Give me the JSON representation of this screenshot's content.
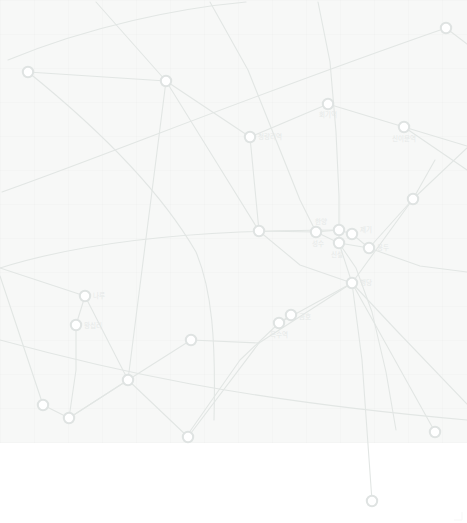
{
  "map": {
    "title": "Seoul Metropolitan Subway Map",
    "panel": {
      "x": 0,
      "y": 0,
      "width": 467,
      "height": 443,
      "background_color": "#f7f8f7"
    },
    "canvas": {
      "width": 467,
      "height": 523,
      "background_color": "#ffffff"
    },
    "style": {
      "node_fill": "#ffffff",
      "node_stroke": "#dfe3e2",
      "node_radius": 5.2,
      "node_stroke_width": 2.0,
      "line_color": "#e2e6e4",
      "line_width": 1.1,
      "label_color": "#e6e9e8",
      "label_font_size": 6.5,
      "opacity_note": "entire map rendered at very low contrast / faded"
    },
    "lines": [
      {
        "id": "line-a",
        "color": "#e2e6e4",
        "path": "M 8,60 C 90,26 180,8 246,2"
      },
      {
        "id": "line-b",
        "color": "#e2e6e4",
        "path": "M 2,192 C 120,150 250,96 446,28"
      },
      {
        "id": "line-c",
        "color": "#e2e6e4",
        "path": "M 28,72 L 166,81 L 250,137 L 328,104 L 404,127 L 467,146"
      },
      {
        "id": "line-d",
        "color": "#e2e6e4",
        "path": "M 96,2 L 166,81 L 215,160 L 259,231 L 300,265 L 352,283 L 396,330 L 467,404"
      },
      {
        "id": "line-e",
        "color": "#e2e6e4",
        "path": "M 210,2 L 248,70 L 276,140 L 300,200 L 316,232 L 339,243 L 356,268 L 372,312 L 386,372 L 396,430"
      },
      {
        "id": "line-f",
        "color": "#e2e6e4",
        "path": "M 318,2 L 330,62 L 336,132 L 339,196 L 339,230 L 339,243 L 352,283 L 362,360 L 372,501"
      },
      {
        "id": "line-g",
        "color": "#e2e6e4",
        "path": "M 28,72 C 100,130 160,190 196,252 C 212,290 216,340 214,420"
      },
      {
        "id": "line-h",
        "color": "#e2e6e4",
        "path": "M 0,268 C 70,246 150,236 240,232 C 300,230 330,230 339,230"
      },
      {
        "id": "line-i",
        "color": "#e2e6e4",
        "path": "M 0,268 L 85,296 L 128,380 L 188,437 L 259,343 L 352,283 L 413,199 L 467,148"
      },
      {
        "id": "line-j",
        "color": "#e2e6e4",
        "path": "M 0,276 L 43,405 L 69,418 L 128,380 L 191,340 L 259,343"
      },
      {
        "id": "line-k",
        "color": "#e2e6e4",
        "path": "M 76,325 L 76,370 L 69,418 L 128,380"
      },
      {
        "id": "line-l",
        "color": "#e2e6e4",
        "path": "M 85,296 L 76,325"
      },
      {
        "id": "line-m",
        "color": "#e2e6e4",
        "path": "M 339,243 L 369,248 L 413,199 L 435,160"
      },
      {
        "id": "line-n",
        "color": "#e2e6e4",
        "path": "M 352,234 L 369,248 L 420,266 L 467,272"
      },
      {
        "id": "line-o",
        "color": "#e2e6e4",
        "path": "M 250,137 L 259,231 L 316,232 L 339,230 L 352,234"
      },
      {
        "id": "line-p",
        "color": "#e2e6e4",
        "path": "M 291,315 L 279,323 L 240,360 L 186,437"
      },
      {
        "id": "line-q",
        "color": "#e2e6e4",
        "path": "M 279,323 L 352,283"
      },
      {
        "id": "line-r",
        "color": "#e2e6e4",
        "path": "M 352,283 L 435,432"
      },
      {
        "id": "line-s",
        "color": "#e2e6e4",
        "path": "M 0,340 C 110,370 240,400 467,420"
      },
      {
        "id": "line-t",
        "color": "#e2e6e4",
        "path": "M 404,127 L 467,170"
      },
      {
        "id": "line-u",
        "color": "#e2e6e4",
        "path": "M 166,81 L 128,380"
      },
      {
        "id": "line-v",
        "color": "#e2e6e4",
        "path": "M 446,28 L 467,44"
      }
    ],
    "stations": [
      {
        "id": "st-01",
        "label": "",
        "x": 28,
        "y": 72
      },
      {
        "id": "st-02",
        "label": "",
        "x": 166,
        "y": 81
      },
      {
        "id": "st-03",
        "label": "",
        "x": 446,
        "y": 28
      },
      {
        "id": "st-04",
        "label": "회기역",
        "x": 328,
        "y": 104,
        "label_dx": 0,
        "label_dy": 13,
        "anchor": "middle"
      },
      {
        "id": "st-05",
        "label": "청량리역",
        "x": 250,
        "y": 137,
        "label_dx": 8,
        "label_dy": 2,
        "anchor": "start"
      },
      {
        "id": "st-06",
        "label": "신이문역",
        "x": 404,
        "y": 127,
        "label_dx": 0,
        "label_dy": 14,
        "anchor": "middle"
      },
      {
        "id": "st-07",
        "label": "",
        "x": 413,
        "y": 199
      },
      {
        "id": "st-08",
        "label": "",
        "x": 259,
        "y": 231
      },
      {
        "id": "st-09",
        "label": "한양",
        "x": 339,
        "y": 230,
        "label_dx": -12,
        "label_dy": -6,
        "anchor": "end"
      },
      {
        "id": "st-10",
        "label": "제기",
        "x": 352,
        "y": 234,
        "label_dx": 8,
        "label_dy": -2,
        "anchor": "start"
      },
      {
        "id": "st-11",
        "label": "신설",
        "x": 339,
        "y": 243,
        "label_dx": -2,
        "label_dy": 14,
        "anchor": "middle"
      },
      {
        "id": "st-12",
        "label": "용두",
        "x": 369,
        "y": 248,
        "label_dx": 8,
        "label_dy": 2,
        "anchor": "start"
      },
      {
        "id": "st-13",
        "label": "나루",
        "x": 85,
        "y": 296,
        "label_dx": 8,
        "label_dy": 2,
        "anchor": "start"
      },
      {
        "id": "st-14",
        "label": "왕십리",
        "x": 76,
        "y": 325,
        "label_dx": 8,
        "label_dy": 3,
        "anchor": "start"
      },
      {
        "id": "st-15",
        "label": "성수",
        "x": 316,
        "y": 232,
        "label_dx": 2,
        "label_dy": 14,
        "anchor": "middle"
      },
      {
        "id": "st-16",
        "label": "행당",
        "x": 352,
        "y": 283,
        "label_dx": 8,
        "label_dy": 2,
        "anchor": "start"
      },
      {
        "id": "st-17",
        "label": "금호",
        "x": 291,
        "y": 315,
        "label_dx": 8,
        "label_dy": 4,
        "anchor": "start"
      },
      {
        "id": "st-18",
        "label": "옥수역",
        "x": 279,
        "y": 323,
        "label_dx": 0,
        "label_dy": 14,
        "anchor": "middle"
      },
      {
        "id": "st-19",
        "label": "",
        "x": 191,
        "y": 340
      },
      {
        "id": "st-20",
        "label": "",
        "x": 128,
        "y": 380
      },
      {
        "id": "st-21",
        "label": "",
        "x": 43,
        "y": 405
      },
      {
        "id": "st-22",
        "label": "",
        "x": 69,
        "y": 418
      },
      {
        "id": "st-23",
        "label": "",
        "x": 188,
        "y": 437
      },
      {
        "id": "st-24",
        "label": "",
        "x": 435,
        "y": 432
      },
      {
        "id": "st-25",
        "label": "",
        "x": 372,
        "y": 501
      }
    ]
  }
}
